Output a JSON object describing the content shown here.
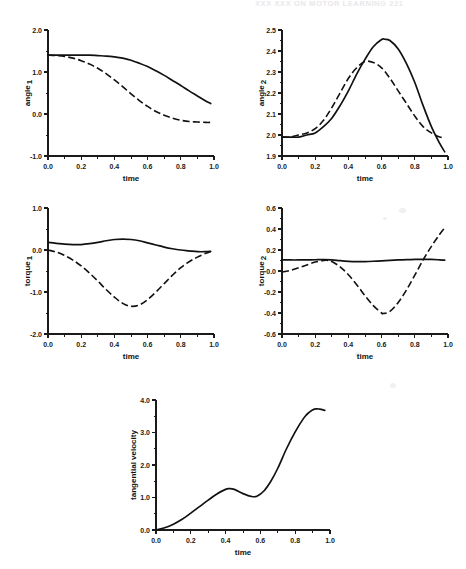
{
  "page": {
    "running_head": "XXX   XXX ON MOTOR LEARNING           221",
    "background_color": "#ffffff",
    "ink_color": "#111111"
  },
  "figure": {
    "panel_count": 5,
    "shared_xlabel": "time",
    "legend_note": "solid and dashed traces, no legend box"
  },
  "chart_data": [
    {
      "id": "panel-angle-1",
      "type": "line",
      "title": "",
      "xlabel": "time",
      "ylabel": "angle",
      "ylabel_subscript": "1",
      "xlim": [
        0.0,
        1.0
      ],
      "ylim": [
        -1.0,
        2.0
      ],
      "xticks": [
        0.0,
        0.2,
        0.4,
        0.6,
        0.8,
        1.0
      ],
      "xtick_labels": [
        "0.0",
        "0.2",
        "0.4",
        "0.6",
        "0.8",
        "1.0"
      ],
      "yticks": [
        -1.0,
        0.0,
        1.0,
        2.0
      ],
      "ytick_labels": [
        "-1.0",
        "0.0",
        "1.0",
        "2.0"
      ],
      "y_minor_step": 0.5,
      "grid": false,
      "series": [
        {
          "name": "solid",
          "style": "solid",
          "x": [
            0.0,
            0.05,
            0.1,
            0.15,
            0.2,
            0.25,
            0.3,
            0.35,
            0.4,
            0.45,
            0.5,
            0.55,
            0.6,
            0.65,
            0.7,
            0.75,
            0.8,
            0.85,
            0.9,
            0.95,
            0.98
          ],
          "values": [
            1.4,
            1.4,
            1.4,
            1.4,
            1.4,
            1.4,
            1.39,
            1.38,
            1.36,
            1.33,
            1.28,
            1.21,
            1.13,
            1.03,
            0.92,
            0.8,
            0.68,
            0.55,
            0.43,
            0.31,
            0.25
          ]
        },
        {
          "name": "dashed",
          "style": "dashed",
          "x": [
            0.0,
            0.05,
            0.1,
            0.15,
            0.2,
            0.25,
            0.3,
            0.35,
            0.4,
            0.45,
            0.5,
            0.55,
            0.6,
            0.65,
            0.7,
            0.75,
            0.8,
            0.85,
            0.9,
            0.95,
            0.98
          ],
          "values": [
            1.4,
            1.39,
            1.37,
            1.33,
            1.27,
            1.19,
            1.09,
            0.96,
            0.81,
            0.65,
            0.48,
            0.32,
            0.18,
            0.06,
            -0.03,
            -0.1,
            -0.15,
            -0.18,
            -0.19,
            -0.2,
            -0.2
          ]
        }
      ]
    },
    {
      "id": "panel-angle-2",
      "type": "line",
      "title": "",
      "xlabel": "time",
      "ylabel": "angle",
      "ylabel_subscript": "2",
      "xlim": [
        0.0,
        1.0
      ],
      "ylim": [
        1.9,
        2.5
      ],
      "xticks": [
        0.0,
        0.2,
        0.4,
        0.6,
        0.8,
        1.0
      ],
      "xtick_labels": [
        "0.0",
        "0.2",
        "0.4",
        "0.6",
        "0.8",
        "1.0"
      ],
      "yticks": [
        1.9,
        2.0,
        2.1,
        2.2,
        2.3,
        2.4,
        2.5
      ],
      "ytick_labels": [
        "1.9",
        "2.0",
        "2.1",
        "2.2",
        "2.3",
        "2.4",
        "2.5"
      ],
      "y_minor_step": 0.05,
      "grid": false,
      "series": [
        {
          "name": "solid",
          "style": "solid",
          "x": [
            0.0,
            0.05,
            0.1,
            0.15,
            0.2,
            0.25,
            0.3,
            0.35,
            0.4,
            0.45,
            0.5,
            0.55,
            0.6,
            0.62,
            0.65,
            0.7,
            0.75,
            0.8,
            0.85,
            0.9,
            0.95,
            0.98
          ],
          "values": [
            1.99,
            1.99,
            1.99,
            2.0,
            2.01,
            2.04,
            2.08,
            2.14,
            2.21,
            2.29,
            2.36,
            2.42,
            2.455,
            2.456,
            2.45,
            2.41,
            2.34,
            2.25,
            2.14,
            2.04,
            1.96,
            1.92
          ]
        },
        {
          "name": "dashed",
          "style": "dashed",
          "x": [
            0.0,
            0.05,
            0.1,
            0.15,
            0.2,
            0.25,
            0.3,
            0.35,
            0.4,
            0.45,
            0.5,
            0.55,
            0.6,
            0.65,
            0.7,
            0.75,
            0.8,
            0.85,
            0.9,
            0.95,
            0.98
          ],
          "values": [
            1.99,
            1.99,
            2.0,
            2.01,
            2.03,
            2.07,
            2.13,
            2.2,
            2.27,
            2.32,
            2.35,
            2.345,
            2.32,
            2.27,
            2.21,
            2.15,
            2.09,
            2.04,
            2.01,
            1.99,
            1.99
          ]
        }
      ]
    },
    {
      "id": "panel-torque-1",
      "type": "line",
      "title": "",
      "xlabel": "time",
      "ylabel": "torque",
      "ylabel_subscript": "1",
      "xlim": [
        0.0,
        1.0
      ],
      "ylim": [
        -2.0,
        1.0
      ],
      "xticks": [
        0.0,
        0.2,
        0.4,
        0.6,
        0.8,
        1.0
      ],
      "xtick_labels": [
        "0.0",
        "0.2",
        "0.4",
        "0.6",
        "0.8",
        "1.0"
      ],
      "yticks": [
        -2.0,
        -1.0,
        0.0,
        1.0
      ],
      "ytick_labels": [
        "-2.0",
        "-1.0",
        "0.0",
        "1.0"
      ],
      "y_minor_step": 0.5,
      "grid": false,
      "series": [
        {
          "name": "solid",
          "style": "solid",
          "x": [
            0.0,
            0.05,
            0.1,
            0.15,
            0.2,
            0.25,
            0.3,
            0.35,
            0.4,
            0.45,
            0.5,
            0.55,
            0.6,
            0.65,
            0.7,
            0.75,
            0.8,
            0.85,
            0.9,
            0.95,
            0.98
          ],
          "values": [
            0.18,
            0.16,
            0.14,
            0.13,
            0.13,
            0.15,
            0.18,
            0.22,
            0.25,
            0.26,
            0.25,
            0.22,
            0.17,
            0.12,
            0.07,
            0.03,
            0.0,
            -0.02,
            -0.04,
            -0.04,
            -0.03
          ]
        },
        {
          "name": "dashed",
          "style": "dashed",
          "x": [
            0.0,
            0.05,
            0.1,
            0.15,
            0.2,
            0.25,
            0.3,
            0.35,
            0.4,
            0.45,
            0.5,
            0.55,
            0.6,
            0.65,
            0.7,
            0.75,
            0.8,
            0.85,
            0.9,
            0.95,
            0.98
          ],
          "values": [
            0.0,
            -0.05,
            -0.13,
            -0.24,
            -0.38,
            -0.55,
            -0.74,
            -0.94,
            -1.12,
            -1.27,
            -1.34,
            -1.31,
            -1.18,
            -1.0,
            -0.8,
            -0.6,
            -0.42,
            -0.28,
            -0.17,
            -0.08,
            -0.04
          ]
        }
      ]
    },
    {
      "id": "panel-torque-2",
      "type": "line",
      "title": "",
      "xlabel": "time",
      "ylabel": "torque",
      "ylabel_subscript": "2",
      "xlim": [
        0.0,
        1.0
      ],
      "ylim": [
        -0.6,
        0.6
      ],
      "xticks": [
        0.0,
        0.2,
        0.4,
        0.6,
        0.8,
        1.0
      ],
      "xtick_labels": [
        "0.0",
        "0.2",
        "0.4",
        "0.6",
        "0.8",
        "1.0"
      ],
      "yticks": [
        -0.6,
        -0.4,
        -0.2,
        0.0,
        0.2,
        0.4,
        0.6
      ],
      "ytick_labels": [
        "-0.6",
        "-0.4",
        "-0.2",
        "0.0",
        "0.2",
        "0.4",
        "0.6"
      ],
      "y_minor_step": 0.1,
      "grid": false,
      "series": [
        {
          "name": "solid",
          "style": "solid",
          "x": [
            0.0,
            0.05,
            0.1,
            0.15,
            0.2,
            0.25,
            0.3,
            0.35,
            0.4,
            0.45,
            0.5,
            0.55,
            0.6,
            0.65,
            0.7,
            0.75,
            0.8,
            0.85,
            0.9,
            0.95,
            0.98
          ],
          "values": [
            0.105,
            0.105,
            0.105,
            0.106,
            0.107,
            0.108,
            0.106,
            0.098,
            0.092,
            0.089,
            0.09,
            0.093,
            0.097,
            0.101,
            0.105,
            0.108,
            0.11,
            0.111,
            0.11,
            0.106,
            0.103
          ]
        },
        {
          "name": "dashed",
          "style": "dashed",
          "x": [
            0.0,
            0.05,
            0.1,
            0.15,
            0.2,
            0.25,
            0.27,
            0.3,
            0.35,
            0.4,
            0.45,
            0.5,
            0.55,
            0.6,
            0.61,
            0.65,
            0.7,
            0.75,
            0.8,
            0.85,
            0.9,
            0.95,
            0.98
          ],
          "values": [
            -0.01,
            0.005,
            0.03,
            0.058,
            0.085,
            0.1,
            0.102,
            0.09,
            0.04,
            -0.035,
            -0.13,
            -0.235,
            -0.33,
            -0.4,
            -0.405,
            -0.385,
            -0.3,
            -0.18,
            -0.04,
            0.105,
            0.235,
            0.35,
            0.41
          ]
        }
      ]
    },
    {
      "id": "panel-tangential-velocity",
      "type": "line",
      "title": "",
      "xlabel": "time",
      "ylabel": "tangential velocity",
      "ylabel_subscript": "",
      "xlim": [
        0.0,
        1.0
      ],
      "ylim": [
        0.0,
        4.0
      ],
      "xticks": [
        0.0,
        0.2,
        0.4,
        0.6,
        0.8,
        1.0
      ],
      "xtick_labels": [
        "0.0",
        "0.2",
        "0.4",
        "0.6",
        "0.8",
        "1.0"
      ],
      "yticks": [
        0.0,
        1.0,
        2.0,
        3.0,
        4.0
      ],
      "ytick_labels": [
        "0.0",
        "1.0",
        "2.0",
        "3.0",
        "4.0"
      ],
      "y_minor_step": 0.5,
      "grid": false,
      "series": [
        {
          "name": "solid",
          "style": "solid",
          "x": [
            0.0,
            0.05,
            0.1,
            0.15,
            0.2,
            0.25,
            0.3,
            0.35,
            0.4,
            0.42,
            0.45,
            0.5,
            0.55,
            0.58,
            0.62,
            0.66,
            0.7,
            0.75,
            0.8,
            0.85,
            0.88,
            0.91,
            0.94,
            0.97
          ],
          "values": [
            0.0,
            0.07,
            0.18,
            0.33,
            0.52,
            0.72,
            0.92,
            1.11,
            1.25,
            1.27,
            1.25,
            1.12,
            1.03,
            1.04,
            1.2,
            1.5,
            1.9,
            2.5,
            3.02,
            3.45,
            3.62,
            3.72,
            3.72,
            3.68
          ]
        }
      ]
    }
  ]
}
